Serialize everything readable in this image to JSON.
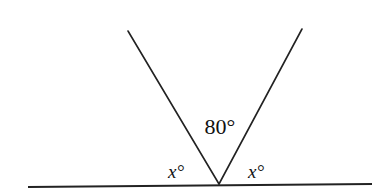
{
  "diagram": {
    "type": "geometry-angles-on-straight-line",
    "stroke_color": "#222222",
    "background": "#ffffff",
    "baseline": {
      "x1": 28,
      "y1": 187,
      "x2": 372,
      "y2": 184
    },
    "vertex": {
      "x": 219,
      "y": 184
    },
    "rays": [
      {
        "id": "left-ray",
        "x1": 219,
        "y1": 184,
        "x2": 128,
        "y2": 31
      },
      {
        "id": "right-ray",
        "x1": 219,
        "y1": 184,
        "x2": 302,
        "y2": 29
      }
    ],
    "labels": {
      "top_angle": {
        "text": "80°",
        "x": 220,
        "y": 134
      },
      "left_angle": {
        "text": "x°",
        "x": 176,
        "y": 178
      },
      "right_angle": {
        "text": "x°",
        "x": 256,
        "y": 178
      }
    }
  }
}
